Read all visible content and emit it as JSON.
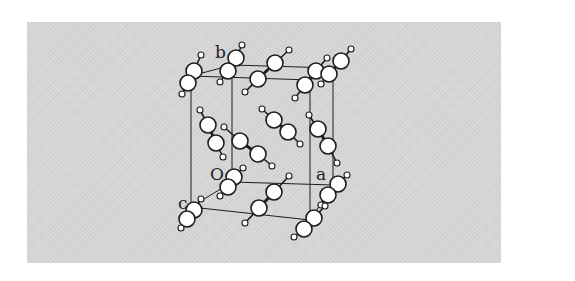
{
  "diagram": {
    "title": "",
    "axis_labels": {
      "origin": "O",
      "a": "a",
      "b": "b",
      "c": "c"
    },
    "colors": {
      "background": "#ffffff",
      "panel": "#d6d6d6",
      "lines": "#1e1e1e",
      "atom_fill": "#ffffff",
      "atom_stroke": "#1e1e1e"
    },
    "cell": {
      "vertices": {
        "O": [
          232,
          182
        ],
        "a": [
          333,
          185
        ],
        "b": [
          232,
          65
        ],
        "c": [
          191,
          207
        ],
        "ab": [
          333,
          68
        ],
        "bc": [
          191,
          76
        ],
        "ac": [
          310,
          220
        ],
        "abc": [
          310,
          80
        ]
      }
    },
    "molecules": [
      {
        "atoms": [
          [
            201,
            55
          ],
          [
            194,
            71
          ],
          [
            188,
            83
          ],
          [
            182,
            94
          ]
        ],
        "sizes": [
          3,
          8,
          8,
          3
        ]
      },
      {
        "atoms": [
          [
            242,
            45
          ],
          [
            236,
            58
          ],
          [
            228,
            71
          ],
          [
            220,
            82
          ]
        ],
        "sizes": [
          3,
          8,
          8,
          3
        ]
      },
      {
        "atoms": [
          [
            289,
            50
          ],
          [
            275,
            63
          ],
          [
            258,
            79
          ],
          [
            245,
            92
          ]
        ],
        "sizes": [
          3,
          8,
          8,
          3
        ]
      },
      {
        "atoms": [
          [
            327,
            58
          ],
          [
            316,
            71
          ],
          [
            305,
            85
          ],
          [
            295,
            98
          ]
        ],
        "sizes": [
          3,
          8,
          8,
          3
        ]
      },
      {
        "atoms": [
          [
            351,
            49
          ],
          [
            341,
            61
          ],
          [
            329,
            74
          ],
          [
            321,
            84
          ]
        ],
        "sizes": [
          3,
          8,
          8,
          3
        ]
      },
      {
        "atoms": [
          [
            200,
            110
          ],
          [
            208,
            125
          ],
          [
            216,
            143
          ],
          [
            223,
            157
          ]
        ],
        "sizes": [
          3,
          8,
          8,
          3
        ]
      },
      {
        "atoms": [
          [
            224,
            127
          ],
          [
            240,
            141
          ],
          [
            258,
            154
          ],
          [
            272,
            166
          ]
        ],
        "sizes": [
          3,
          8,
          8,
          3
        ]
      },
      {
        "atoms": [
          [
            262,
            109
          ],
          [
            274,
            120
          ],
          [
            288,
            132
          ],
          [
            300,
            144
          ]
        ],
        "sizes": [
          3,
          8,
          8,
          3
        ]
      },
      {
        "atoms": [
          [
            309,
            115
          ],
          [
            318,
            129
          ],
          [
            328,
            146
          ],
          [
            337,
            163
          ]
        ],
        "sizes": [
          3,
          8,
          8,
          3
        ]
      },
      {
        "atoms": [
          [
            243,
            168
          ],
          [
            234,
            177
          ],
          [
            228,
            187
          ],
          [
            220,
            196
          ]
        ],
        "sizes": [
          3,
          8,
          8,
          3
        ]
      },
      {
        "atoms": [
          [
            289,
            176
          ],
          [
            274,
            192
          ],
          [
            259,
            208
          ],
          [
            245,
            223
          ]
        ],
        "sizes": [
          3,
          8,
          8,
          3
        ]
      },
      {
        "atoms": [
          [
            347,
            175
          ],
          [
            338,
            184
          ],
          [
            328,
            195
          ],
          [
            321,
            205
          ]
        ],
        "sizes": [
          3,
          8,
          8,
          3
        ]
      },
      {
        "atoms": [
          [
            201,
            199
          ],
          [
            194,
            210
          ],
          [
            187,
            219
          ],
          [
            181,
            228
          ]
        ],
        "sizes": [
          3,
          8,
          8,
          3
        ]
      },
      {
        "atoms": [
          [
            325,
            206
          ],
          [
            314,
            218
          ],
          [
            304,
            229
          ],
          [
            294,
            237
          ]
        ],
        "sizes": [
          3,
          8,
          8,
          3
        ]
      }
    ]
  }
}
